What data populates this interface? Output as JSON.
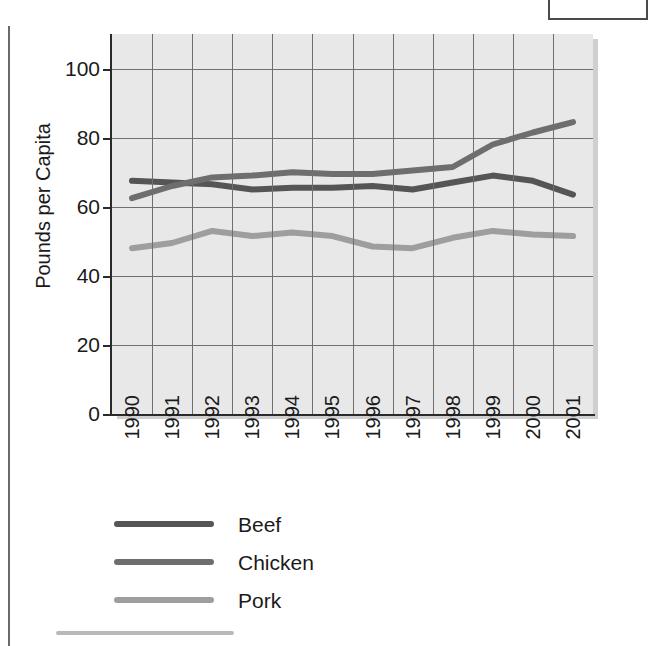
{
  "figure": {
    "y_axis_title": "Pounds per Capita"
  },
  "chart_data": {
    "type": "line",
    "title": "",
    "subtitle": "",
    "xlabel": "",
    "ylabel": "Pounds per Capita",
    "categories": [
      "1990",
      "1991",
      "1992",
      "1993",
      "1994",
      "1995",
      "1996",
      "1997",
      "1998",
      "1999",
      "2000",
      "2001"
    ],
    "x": [
      1990,
      1991,
      1992,
      1993,
      1994,
      1995,
      1996,
      1997,
      1998,
      1999,
      2000,
      2001
    ],
    "ylim": [
      0,
      110
    ],
    "y_ticks": [
      0,
      20,
      40,
      60,
      80,
      100
    ],
    "y_tick_labels": [
      "0",
      "20",
      "40",
      "60",
      "80",
      "100"
    ],
    "grid": true,
    "legend_position": "below",
    "series": [
      {
        "name": "Beef",
        "color": "#555555",
        "values": [
          67.5,
          67.0,
          66.5,
          65.0,
          65.5,
          65.5,
          66.0,
          65.0,
          67.0,
          69.0,
          67.5,
          63.5
        ]
      },
      {
        "name": "Chicken",
        "color": "#6e6e6e",
        "values": [
          62.5,
          66.0,
          68.5,
          69.0,
          70.0,
          69.5,
          69.5,
          70.5,
          71.5,
          78.0,
          81.5,
          84.5
        ]
      },
      {
        "name": "Pork",
        "color": "#9e9e9e",
        "values": [
          48.0,
          49.5,
          53.0,
          51.5,
          52.5,
          51.5,
          48.5,
          48.0,
          51.0,
          53.0,
          52.0,
          51.5
        ]
      }
    ]
  },
  "legend": {
    "items": [
      {
        "label": "Beef",
        "color": "#555555"
      },
      {
        "label": "Chicken",
        "color": "#6e6e6e"
      },
      {
        "label": "Pork",
        "color": "#9e9e9e"
      }
    ]
  }
}
